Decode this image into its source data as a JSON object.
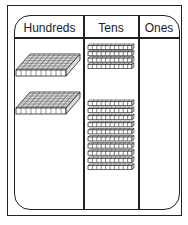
{
  "chart": {
    "headers": [
      "Hundreds",
      "Tens",
      "Ones"
    ],
    "hundreds_count": 2,
    "tens_count": 14,
    "tens_groups": [
      4,
      10
    ],
    "ones_count": 0
  },
  "chart_data": {
    "type": "table",
    "columns": [
      "Hundreds",
      "Tens",
      "Ones"
    ],
    "rows": [
      {
        "Hundreds": 2,
        "Tens": 14,
        "Ones": 0
      }
    ],
    "representation": "base-ten blocks: flats=hundreds, rods=tens, units=ones"
  }
}
